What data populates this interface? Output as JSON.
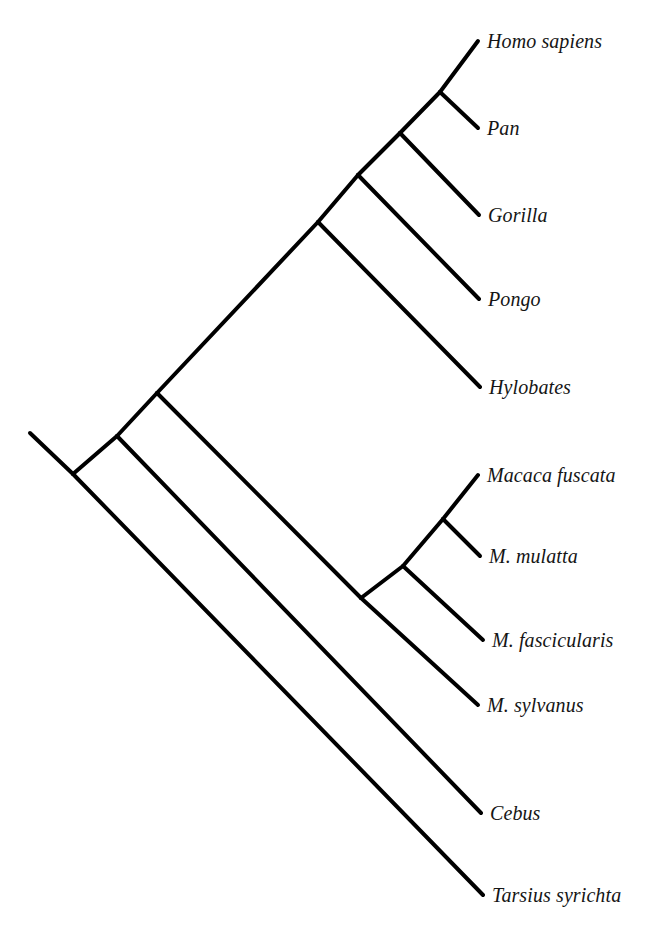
{
  "figure": {
    "kind": "phylogenetic-tree",
    "style": "slanted-cladogram",
    "background_color": "#ffffff",
    "line_color": "#000000",
    "line_width": 4,
    "label_color": "#151515",
    "label_style": "italic-serif",
    "width": 659,
    "height": 933
  },
  "taxa": [
    {
      "id": "homo-sapiens",
      "label": "Homo sapiens",
      "tip_x": 478,
      "tip_y": 41,
      "label_x": 487,
      "label_y": 41
    },
    {
      "id": "pan",
      "label": "Pan",
      "tip_x": 478,
      "tip_y": 128,
      "label_x": 487,
      "label_y": 128
    },
    {
      "id": "gorilla",
      "label": "Gorilla",
      "tip_x": 479,
      "tip_y": 215,
      "label_x": 488,
      "label_y": 215
    },
    {
      "id": "pongo",
      "label": "Pongo",
      "tip_x": 479,
      "tip_y": 299,
      "label_x": 488,
      "label_y": 299
    },
    {
      "id": "hylobates",
      "label": "Hylobates",
      "tip_x": 480,
      "tip_y": 387,
      "label_x": 489,
      "label_y": 387
    },
    {
      "id": "macaca-fuscata",
      "label": "Macaca fuscata",
      "tip_x": 478,
      "tip_y": 475,
      "label_x": 487,
      "label_y": 475
    },
    {
      "id": "m-mulatta",
      "label": "M. mulatta",
      "tip_x": 480,
      "tip_y": 556,
      "label_x": 489,
      "label_y": 556
    },
    {
      "id": "m-fascicularis",
      "label": "M. fascicularis",
      "tip_x": 483,
      "tip_y": 640,
      "label_x": 492,
      "label_y": 640
    },
    {
      "id": "m-sylvanus",
      "label": "M. sylvanus",
      "tip_x": 478,
      "tip_y": 705,
      "label_x": 487,
      "label_y": 705
    },
    {
      "id": "cebus",
      "label": "Cebus",
      "tip_x": 481,
      "tip_y": 813,
      "label_x": 490,
      "label_y": 813
    },
    {
      "id": "tarsius-syrichta",
      "label": "Tarsius syrichta",
      "tip_x": 483,
      "tip_y": 895,
      "label_x": 492,
      "label_y": 895
    }
  ],
  "nodes": [
    {
      "id": "root-stem-start",
      "x": 30,
      "y": 433
    },
    {
      "id": "root",
      "x": 73,
      "y": 474
    },
    {
      "id": "haplorhini-node",
      "x": 117,
      "y": 436
    },
    {
      "id": "simiiformes-node",
      "x": 157,
      "y": 393
    },
    {
      "id": "catarrhini-node",
      "x": 318,
      "y": 222
    },
    {
      "id": "hominoidea-node",
      "x": 358,
      "y": 175
    },
    {
      "id": "hominidae-node",
      "x": 400,
      "y": 133
    },
    {
      "id": "homininae-node",
      "x": 440,
      "y": 92
    },
    {
      "id": "cercopithecid-node",
      "x": 361,
      "y": 598
    },
    {
      "id": "macaca-node",
      "x": 403,
      "y": 566
    },
    {
      "id": "macaca-sub-node",
      "x": 443,
      "y": 519
    }
  ],
  "branches": [
    {
      "id": "root-stem",
      "from": "root-stem-start",
      "to": "root"
    },
    {
      "id": "root-to-tarsius",
      "from": "root",
      "to": "tarsius-syrichta"
    },
    {
      "id": "root-to-haplorhini",
      "from": "root",
      "to": "haplorhini-node"
    },
    {
      "id": "haplorhini-to-cebus",
      "from": "haplorhini-node",
      "to": "cebus"
    },
    {
      "id": "haplorhini-to-simii",
      "from": "haplorhini-node",
      "to": "simiiformes-node"
    },
    {
      "id": "simii-to-cercopithecid",
      "from": "simiiformes-node",
      "to": "cercopithecid-node"
    },
    {
      "id": "simii-to-catarrhini",
      "from": "simiiformes-node",
      "to": "catarrhini-node"
    },
    {
      "id": "catarrhini-to-hylobates",
      "from": "catarrhini-node",
      "to": "hylobates"
    },
    {
      "id": "catarrhini-to-hominoid",
      "from": "catarrhini-node",
      "to": "hominoidea-node"
    },
    {
      "id": "hominoid-to-pongo",
      "from": "hominoidea-node",
      "to": "pongo"
    },
    {
      "id": "hominoid-to-hominidae",
      "from": "hominoidea-node",
      "to": "hominidae-node"
    },
    {
      "id": "hominidae-to-gorilla",
      "from": "hominidae-node",
      "to": "gorilla"
    },
    {
      "id": "hominidae-to-homininae",
      "from": "hominidae-node",
      "to": "homininae-node"
    },
    {
      "id": "homininae-to-homo",
      "from": "homininae-node",
      "to": "homo-sapiens"
    },
    {
      "id": "homininae-to-pan",
      "from": "homininae-node",
      "to": "pan"
    },
    {
      "id": "cercopithecid-to-sylv",
      "from": "cercopithecid-node",
      "to": "m-sylvanus"
    },
    {
      "id": "cercopithecid-to-macaca",
      "from": "cercopithecid-node",
      "to": "macaca-node"
    },
    {
      "id": "macaca-to-fascicularis",
      "from": "macaca-node",
      "to": "m-fascicularis"
    },
    {
      "id": "macaca-to-subnode",
      "from": "macaca-node",
      "to": "macaca-sub-node"
    },
    {
      "id": "subnode-to-fuscata",
      "from": "macaca-sub-node",
      "to": "macaca-fuscata"
    },
    {
      "id": "subnode-to-mulatta",
      "from": "macaca-sub-node",
      "to": "m-mulatta"
    }
  ]
}
